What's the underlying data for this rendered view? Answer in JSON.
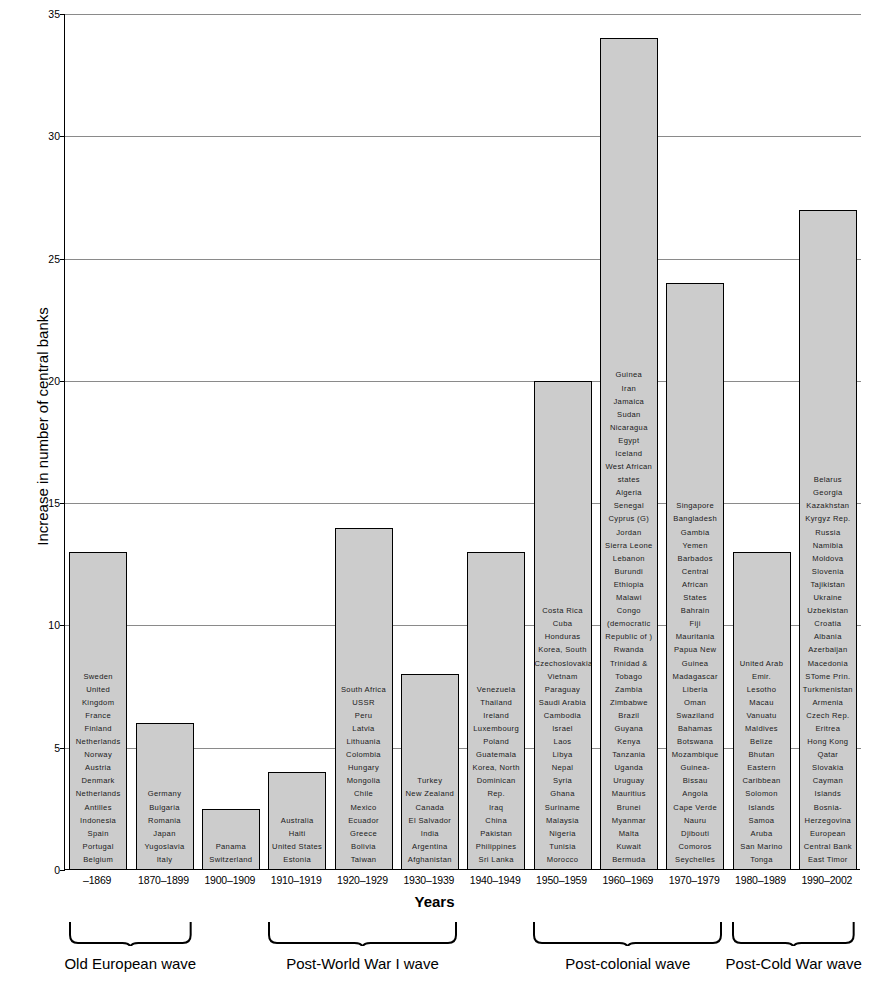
{
  "chart_data": {
    "type": "bar",
    "title": "",
    "xlabel": "Years",
    "ylabel": "Increase in number of central banks",
    "ylim": [
      0,
      35
    ],
    "yticks": [
      0,
      5,
      10,
      15,
      20,
      25,
      30,
      35
    ],
    "grid": true,
    "legend": "none",
    "categories": [
      "–1869",
      "1870–1899",
      "1900–1909",
      "1910–1919",
      "1920–1929",
      "1930–1939",
      "1940–1949",
      "1950–1959",
      "1960–1969",
      "1970–1979",
      "1980–1989",
      "1990–2002"
    ],
    "values": [
      13,
      6,
      2.5,
      4,
      14,
      8,
      13,
      20,
      34,
      24,
      13,
      27
    ],
    "bar_labels": [
      [
        "Sweden",
        "United",
        "Kingdom",
        "France",
        "Finland",
        "Netherlands",
        "Norway",
        "Austria",
        "Denmark",
        "Netherlands",
        "Antilles",
        "Indonesia",
        "Spain",
        "Portugal",
        "Belgium"
      ],
      [
        "Germany",
        "Bulgaria",
        "Romania",
        "Japan",
        "Yugoslavia",
        "Italy"
      ],
      [
        "Panama",
        "Switzerland"
      ],
      [
        "Australia",
        "Haiti",
        "United States",
        "Estonia"
      ],
      [
        "South Africa",
        "USSR",
        "Peru",
        "Latvia",
        "Lithuania",
        "Colombia",
        "Hungary",
        "Mongolia",
        "Chile",
        "Mexico",
        "Ecuador",
        "Greece",
        "Bolivia",
        "Taiwan"
      ],
      [
        "Turkey",
        "New Zealand",
        "Canada",
        "El Salvador",
        "India",
        "Argentina",
        "Afghanistan"
      ],
      [
        "Venezuela",
        "Thailand",
        "Ireland",
        "Luxembourg",
        "Poland",
        "Guatemala",
        "Korea, North",
        "Dominican",
        "Rep.",
        "Iraq",
        "China",
        "Pakistan",
        "Philippines",
        "Sri Lanka"
      ],
      [
        "Costa Rica",
        "Cuba",
        "Honduras",
        "Korea, South",
        "Czechoslovakia",
        "Vietnam",
        "Paraguay",
        "Saudi Arabia",
        "Cambodia",
        "Israel",
        "Laos",
        "Libya",
        "Nepal",
        "Syria",
        "Ghana",
        "Suriname",
        "Malaysia",
        "Nigeria",
        "Tunisia",
        "Morocco"
      ],
      [
        "Guinea",
        "Iran",
        "Jamaica",
        "Sudan",
        "Nicaragua",
        "Egypt",
        "Iceland",
        "West African",
        "states",
        "Algeria",
        "Senegal",
        "Cyprus (G)",
        "Jordan",
        "Sierra Leone",
        "Lebanon",
        "Burundi",
        "Ethiopia",
        "Malawi",
        "Congo",
        "(democratic",
        "Republic of )",
        "Rwanda",
        "Trinidad &",
        "Tobago",
        "Zambia",
        "Zimbabwe",
        "Brazil",
        "Guyana",
        "Kenya",
        "Tanzania",
        "Uganda",
        "Uruguay",
        "Mauritius",
        "Brunei",
        "Myanmar",
        "Malta",
        "Kuwait",
        "Bermuda"
      ],
      [
        "Singapore",
        "Bangladesh",
        "Gambia",
        "Yemen",
        "Barbados",
        "Central",
        "African",
        "States",
        "Bahrain",
        "Fiji",
        "Mauritania",
        "Papua New",
        "Guinea",
        "Madagascar",
        "Liberia",
        "Oman",
        "Swaziland",
        "Bahamas",
        "Botswana",
        "Mozambique",
        "Guinea-",
        "Bissau",
        "Angola",
        "Cape Verde",
        "Nauru",
        "Djibouti",
        "Comoros",
        "Seychelles"
      ],
      [
        "United Arab",
        "Emir.",
        "Lesotho",
        "Macau",
        "Vanuatu",
        "Maldives",
        "Belize",
        "Bhutan",
        "Eastern",
        "Caribbean",
        "Solomon",
        "Islands",
        "Samoa",
        "Aruba",
        "San Marino",
        "Tonga"
      ],
      [
        "Belarus",
        "Georgia",
        "Kazakhstan",
        "Kyrgyz Rep.",
        "Russia",
        "Namibia",
        "Moldova",
        "Slovenia",
        "Tajikistan",
        "Ukraine",
        "Uzbekistan",
        "Croatia",
        "Albania",
        "Azerbaijan",
        "Macedonia",
        "STome Prin.",
        "Turkmenistan",
        "Armenia",
        "Czech Rep.",
        "Eritrea",
        "Hong Kong",
        "Qatar",
        "Slovakia",
        "Cayman",
        "Islands",
        "Bosnia-",
        "Herzegovina",
        "European",
        "Central Bank",
        "East Timor"
      ]
    ],
    "waves": [
      {
        "label": "Old European wave",
        "start_index": 0,
        "end_index": 1
      },
      {
        "label": "Post-World War I wave",
        "start_index": 3,
        "end_index": 5
      },
      {
        "label": "Post-colonial wave",
        "start_index": 7,
        "end_index": 9
      },
      {
        "label": "Post-Cold War wave",
        "start_index": 10,
        "end_index": 11
      }
    ],
    "colors": {
      "bar_fill": "#cccccc",
      "bar_stroke": "#000000",
      "grid": "#8a8a8a",
      "text": "#000000"
    }
  }
}
